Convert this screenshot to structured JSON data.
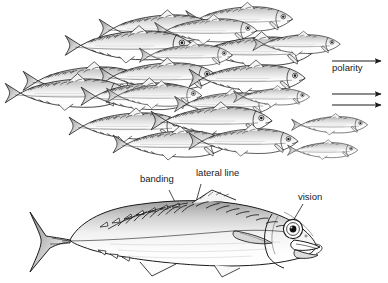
{
  "figure": {
    "background_color": "#ffffff",
    "ink_color": "#1a1a1a",
    "panels": [
      {
        "name": "school-panel",
        "description": "school of mackerel swimming in parallel, all facing right"
      },
      {
        "name": "specimen-panel",
        "description": "single large mackerel in lateral view, facing right"
      }
    ]
  },
  "labels": {
    "polarity": "polarity",
    "banding": "banding",
    "lateral_line": "lateral line",
    "vision": "vision"
  },
  "arrows": {
    "name": "polarity-arrows",
    "count": 3,
    "direction": "right",
    "items": [
      {
        "x1": 332,
        "y1": 61,
        "x2": 383,
        "y2": 61
      },
      {
        "x1": 332,
        "y1": 94,
        "x2": 383,
        "y2": 94
      },
      {
        "x1": 332,
        "y1": 105,
        "x2": 383,
        "y2": 105
      }
    ]
  },
  "leaders": [
    {
      "name": "banding-leader",
      "x1": 168,
      "y1": 190,
      "x2": 178,
      "y2": 208
    },
    {
      "name": "lateral-line-leader",
      "x1": 200,
      "y1": 184,
      "x2": 194,
      "y2": 207
    },
    {
      "name": "vision-leader",
      "x1": 303,
      "y1": 205,
      "x2": 294,
      "y2": 222
    }
  ],
  "label_positions": {
    "polarity": {
      "x": 332,
      "y": 68
    },
    "banding": {
      "x": 140,
      "y": 179
    },
    "lateral_line": {
      "x": 197,
      "y": 173
    },
    "vision": {
      "x": 299,
      "y": 197
    }
  },
  "school": {
    "fish_count": 22,
    "orientation": "all-facing-right",
    "rows": [
      {
        "row": 1,
        "y_band": "8-55"
      },
      {
        "row": 2,
        "y_band": "55-100"
      },
      {
        "row": 3,
        "y_band": "95-135"
      },
      {
        "row": 4,
        "y_band": "125-170"
      }
    ]
  },
  "specimen": {
    "name": "mackerel",
    "features": [
      "caudal-fin",
      "caudal-finlets",
      "dorsal-fin",
      "pectoral-fin",
      "pelvic-fin",
      "anal-fin",
      "gill-cover",
      "eye",
      "mouth",
      "banding-stripes",
      "lateral-line"
    ]
  }
}
